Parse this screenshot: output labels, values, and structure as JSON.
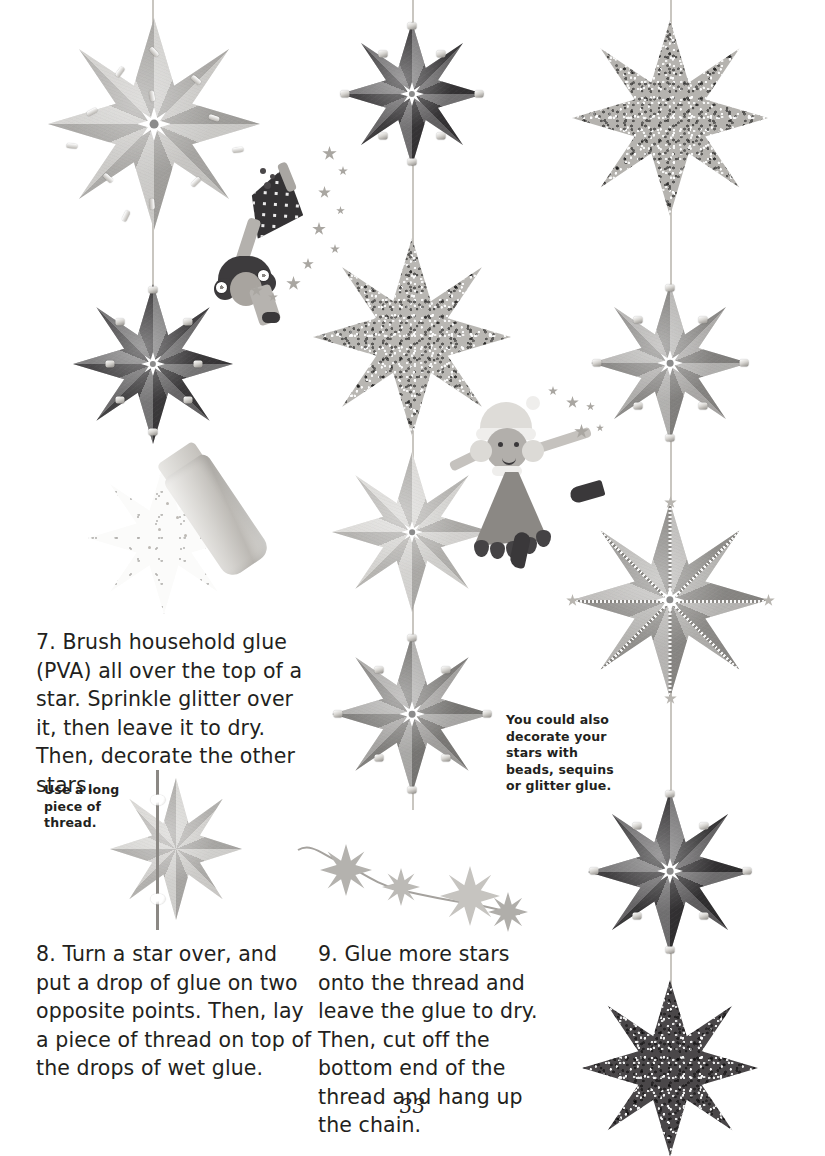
{
  "page": {
    "number": "33",
    "background_color": "#ffffff",
    "text_color": "#231f20"
  },
  "instructions": [
    {
      "id": "step-7",
      "number": "7",
      "text": "7. Brush household glue (PVA) all over the top of a star. Sprinkle glitter over it, then leave it to dry. Then, decorate the other stars."
    },
    {
      "id": "step-8",
      "number": "8",
      "text": "8. Turn a star over, and put a drop of glue on two opposite points. Then, lay a piece of thread on top of the drops of wet glue."
    },
    {
      "id": "step-9",
      "number": "9",
      "text": "9. Glue more stars onto the thread and leave the glue to dry. Then, cut off the bottom end of the thread and hang up the chain."
    }
  ],
  "notes": [
    {
      "id": "note-thread",
      "text": "Use a long piece of thread."
    },
    {
      "id": "note-decorate",
      "text": "You could also decorate your stars with beads, sequins or glitter glue."
    }
  ],
  "illustrations": {
    "glitter_shaker": "glitter-shaker-icon",
    "fairy_top": "fairy-with-flowers-icon",
    "fairy_middle": "fairy-in-dress-icon",
    "star_chain": "glitter-star-chain-icon",
    "glue_star": "star-with-glitter-icon",
    "thread_star": "star-with-thread-icon"
  },
  "stars": {
    "left_column": [
      {
        "id": "star-left-1",
        "finish": "paper",
        "color": "#c6c4c0",
        "decoration": "sequins",
        "size": 212
      },
      {
        "id": "star-left-2",
        "finish": "paper",
        "color": "#3a383a",
        "decoration": "beads",
        "size": 160
      }
    ],
    "middle_column": [
      {
        "id": "star-mid-1",
        "finish": "paper",
        "color": "#333133",
        "decoration": "beads",
        "size": 144
      },
      {
        "id": "star-mid-2",
        "finish": "glitter",
        "color": "#b9b7b3",
        "decoration": "none",
        "size": 198
      },
      {
        "id": "star-mid-3",
        "finish": "paper",
        "color": "#d4d2ce",
        "decoration": "none",
        "size": 160
      },
      {
        "id": "star-mid-4",
        "finish": "paper",
        "color": "#8d8b88",
        "decoration": "beads",
        "size": 160
      }
    ],
    "right_column": [
      {
        "id": "star-right-1",
        "finish": "glitter",
        "color": "#b5b3af",
        "decoration": "none",
        "size": 196
      },
      {
        "id": "star-right-2",
        "finish": "paper",
        "color": "#9b9996",
        "decoration": "beads",
        "size": 158
      },
      {
        "id": "star-right-3",
        "finish": "paper",
        "color": "#a3a19d",
        "decoration": "glitter-glue",
        "size": 196
      },
      {
        "id": "star-right-4",
        "finish": "paper",
        "color": "#2e2c2e",
        "decoration": "beads",
        "size": 164
      },
      {
        "id": "star-right-5",
        "finish": "glitter",
        "color": "#4a4749",
        "decoration": "none",
        "size": 176
      }
    ],
    "chain_stars": [
      {
        "id": "chain-star-1",
        "color": "#b4b2ae",
        "size": 52
      },
      {
        "id": "chain-star-2",
        "color": "#bcbab6",
        "size": 38
      },
      {
        "id": "chain-star-3",
        "color": "#c6c4c0",
        "size": 60
      },
      {
        "id": "chain-star-4",
        "color": "#b0aeaa",
        "size": 40
      }
    ]
  }
}
